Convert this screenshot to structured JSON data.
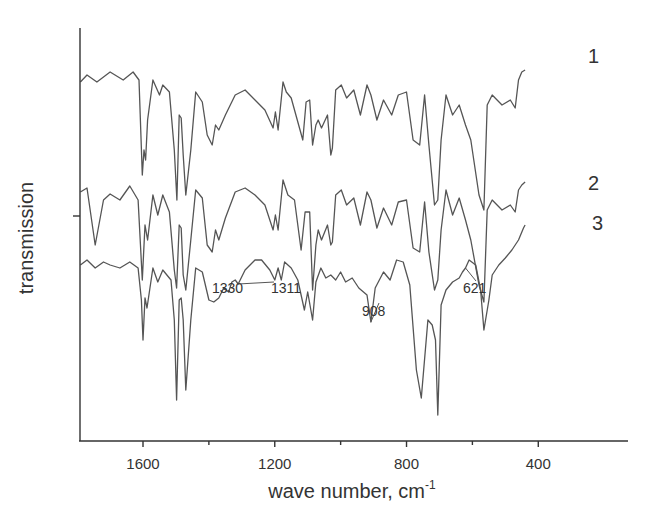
{
  "chart_data": {
    "type": "line",
    "title": "",
    "xlabel": "wave number, cm",
    "xlabel_superscript": "-1",
    "ylabel": "transmission",
    "xlim": [
      1800,
      330
    ],
    "x_reversed": true,
    "x_ticks": [
      1600,
      1200,
      800,
      400
    ],
    "x_minor_ticks": [
      1400,
      1000,
      600
    ],
    "y_ticks": [],
    "grid": false,
    "legend": "inline labels at right end of curves",
    "series": [
      {
        "name": "1",
        "offset": 0,
        "points": [
          [
            1790,
            62
          ],
          [
            1770,
            55
          ],
          [
            1740,
            62
          ],
          [
            1700,
            52
          ],
          [
            1660,
            60
          ],
          [
            1630,
            52
          ],
          [
            1612,
            60
          ],
          [
            1602,
            155
          ],
          [
            1597,
            130
          ],
          [
            1592,
            140
          ],
          [
            1586,
            100
          ],
          [
            1570,
            60
          ],
          [
            1550,
            75
          ],
          [
            1540,
            65
          ],
          [
            1520,
            72
          ],
          [
            1505,
            130
          ],
          [
            1497,
            180
          ],
          [
            1490,
            95
          ],
          [
            1484,
            98
          ],
          [
            1478,
            135
          ],
          [
            1470,
            175
          ],
          [
            1455,
            130
          ],
          [
            1440,
            72
          ],
          [
            1420,
            82
          ],
          [
            1405,
            115
          ],
          [
            1390,
            125
          ],
          [
            1380,
            105
          ],
          [
            1370,
            110
          ],
          [
            1350,
            95
          ],
          [
            1320,
            75
          ],
          [
            1290,
            70
          ],
          [
            1260,
            80
          ],
          [
            1230,
            90
          ],
          [
            1205,
            108
          ],
          [
            1198,
            92
          ],
          [
            1190,
            110
          ],
          [
            1175,
            62
          ],
          [
            1165,
            72
          ],
          [
            1150,
            78
          ],
          [
            1115,
            120
          ],
          [
            1105,
            82
          ],
          [
            1094,
            80
          ],
          [
            1085,
            125
          ],
          [
            1075,
            105
          ],
          [
            1068,
            100
          ],
          [
            1058,
            108
          ],
          [
            1040,
            95
          ],
          [
            1030,
            135
          ],
          [
            1025,
            128
          ],
          [
            1015,
            70
          ],
          [
            998,
            65
          ],
          [
            982,
            78
          ],
          [
            960,
            70
          ],
          [
            940,
            95
          ],
          [
            920,
            65
          ],
          [
            908,
            75
          ],
          [
            890,
            100
          ],
          [
            870,
            80
          ],
          [
            845,
            95
          ],
          [
            825,
            75
          ],
          [
            800,
            72
          ],
          [
            780,
            120
          ],
          [
            760,
            125
          ],
          [
            745,
            75
          ],
          [
            732,
            125
          ],
          [
            715,
            185
          ],
          [
            705,
            180
          ],
          [
            695,
            120
          ],
          [
            680,
            75
          ],
          [
            660,
            95
          ],
          [
            640,
            85
          ],
          [
            621,
            105
          ],
          [
            605,
            120
          ],
          [
            580,
            175
          ],
          [
            565,
            190
          ],
          [
            555,
            85
          ],
          [
            540,
            75
          ],
          [
            510,
            85
          ],
          [
            485,
            80
          ],
          [
            470,
            88
          ],
          [
            460,
            60
          ],
          [
            450,
            52
          ],
          [
            440,
            50
          ]
        ]
      },
      {
        "name": "2",
        "offset": 110,
        "points": [
          [
            1790,
            62
          ],
          [
            1770,
            58
          ],
          [
            1745,
            115
          ],
          [
            1720,
            70
          ],
          [
            1700,
            64
          ],
          [
            1670,
            70
          ],
          [
            1640,
            56
          ],
          [
            1615,
            70
          ],
          [
            1602,
            150
          ],
          [
            1594,
            95
          ],
          [
            1586,
            110
          ],
          [
            1570,
            65
          ],
          [
            1555,
            85
          ],
          [
            1540,
            65
          ],
          [
            1520,
            82
          ],
          [
            1505,
            140
          ],
          [
            1498,
            158
          ],
          [
            1490,
            95
          ],
          [
            1484,
            98
          ],
          [
            1478,
            145
          ],
          [
            1470,
            160
          ],
          [
            1455,
            110
          ],
          [
            1440,
            60
          ],
          [
            1420,
            68
          ],
          [
            1405,
            115
          ],
          [
            1390,
            122
          ],
          [
            1380,
            100
          ],
          [
            1370,
            110
          ],
          [
            1350,
            88
          ],
          [
            1320,
            62
          ],
          [
            1290,
            58
          ],
          [
            1260,
            65
          ],
          [
            1230,
            75
          ],
          [
            1205,
            100
          ],
          [
            1198,
            85
          ],
          [
            1190,
            100
          ],
          [
            1175,
            50
          ],
          [
            1160,
            65
          ],
          [
            1140,
            70
          ],
          [
            1120,
            120
          ],
          [
            1108,
            82
          ],
          [
            1094,
            82
          ],
          [
            1085,
            160
          ],
          [
            1075,
            115
          ],
          [
            1068,
            100
          ],
          [
            1058,
            110
          ],
          [
            1040,
            95
          ],
          [
            1030,
            115
          ],
          [
            1025,
            112
          ],
          [
            1015,
            65
          ],
          [
            998,
            60
          ],
          [
            982,
            75
          ],
          [
            960,
            68
          ],
          [
            940,
            95
          ],
          [
            920,
            62
          ],
          [
            908,
            70
          ],
          [
            890,
            98
          ],
          [
            870,
            78
          ],
          [
            845,
            95
          ],
          [
            825,
            72
          ],
          [
            800,
            70
          ],
          [
            780,
            118
          ],
          [
            760,
            122
          ],
          [
            745,
            72
          ],
          [
            732,
            122
          ],
          [
            715,
            160
          ],
          [
            705,
            150
          ],
          [
            695,
            100
          ],
          [
            680,
            60
          ],
          [
            660,
            85
          ],
          [
            640,
            68
          ],
          [
            621,
            90
          ],
          [
            605,
            110
          ],
          [
            580,
            155
          ],
          [
            565,
            172
          ],
          [
            555,
            80
          ],
          [
            540,
            70
          ],
          [
            510,
            80
          ],
          [
            485,
            75
          ],
          [
            470,
            82
          ],
          [
            460,
            60
          ],
          [
            450,
            55
          ],
          [
            440,
            52
          ]
        ]
      },
      {
        "name": "3",
        "offset": 190,
        "points": [
          [
            1790,
            55
          ],
          [
            1770,
            50
          ],
          [
            1745,
            58
          ],
          [
            1720,
            52
          ],
          [
            1700,
            55
          ],
          [
            1670,
            58
          ],
          [
            1640,
            52
          ],
          [
            1615,
            58
          ],
          [
            1605,
            90
          ],
          [
            1600,
            130
          ],
          [
            1594,
            88
          ],
          [
            1588,
            98
          ],
          [
            1570,
            58
          ],
          [
            1555,
            72
          ],
          [
            1540,
            60
          ],
          [
            1515,
            70
          ],
          [
            1505,
            110
          ],
          [
            1498,
            190
          ],
          [
            1490,
            90
          ],
          [
            1484,
            88
          ],
          [
            1478,
            110
          ],
          [
            1470,
            180
          ],
          [
            1455,
            110
          ],
          [
            1440,
            58
          ],
          [
            1420,
            62
          ],
          [
            1400,
            90
          ],
          [
            1385,
            92
          ],
          [
            1370,
            88
          ],
          [
            1355,
            78
          ],
          [
            1340,
            82
          ],
          [
            1330,
            72
          ],
          [
            1320,
            70
          ],
          [
            1311,
            74
          ],
          [
            1290,
            60
          ],
          [
            1260,
            50
          ],
          [
            1240,
            50
          ],
          [
            1215,
            60
          ],
          [
            1200,
            70
          ],
          [
            1190,
            58
          ],
          [
            1180,
            70
          ],
          [
            1170,
            52
          ],
          [
            1150,
            58
          ],
          [
            1130,
            70
          ],
          [
            1110,
            100
          ],
          [
            1100,
            82
          ],
          [
            1085,
            110
          ],
          [
            1075,
            72
          ],
          [
            1060,
            58
          ],
          [
            1045,
            68
          ],
          [
            1030,
            65
          ],
          [
            1015,
            70
          ],
          [
            1000,
            62
          ],
          [
            985,
            72
          ],
          [
            965,
            68
          ],
          [
            945,
            78
          ],
          [
            920,
            85
          ],
          [
            908,
            112
          ],
          [
            895,
            78
          ],
          [
            870,
            62
          ],
          [
            850,
            70
          ],
          [
            830,
            50
          ],
          [
            810,
            52
          ],
          [
            790,
            75
          ],
          [
            770,
            160
          ],
          [
            755,
            188
          ],
          [
            735,
            110
          ],
          [
            722,
            115
          ],
          [
            712,
            130
          ],
          [
            705,
            205
          ],
          [
            695,
            95
          ],
          [
            680,
            80
          ],
          [
            660,
            72
          ],
          [
            640,
            68
          ],
          [
            630,
            62
          ],
          [
            621,
            58
          ],
          [
            610,
            50
          ],
          [
            590,
            55
          ],
          [
            575,
            80
          ],
          [
            565,
            120
          ],
          [
            550,
            90
          ],
          [
            540,
            65
          ],
          [
            520,
            55
          ],
          [
            500,
            48
          ],
          [
            480,
            40
          ],
          [
            460,
            30
          ],
          [
            445,
            18
          ],
          [
            440,
            15
          ]
        ]
      }
    ],
    "annotations": [
      {
        "label": "1330",
        "x": 1330,
        "series": "3"
      },
      {
        "label": "1311",
        "x": 1311,
        "series": "3"
      },
      {
        "label": "908",
        "x": 908,
        "series": "3"
      },
      {
        "label": "621",
        "x": 621,
        "series": "3"
      }
    ]
  },
  "colors": {
    "line": "#555555",
    "axis": "#333333",
    "text": "#333333",
    "background": "#ffffff"
  }
}
